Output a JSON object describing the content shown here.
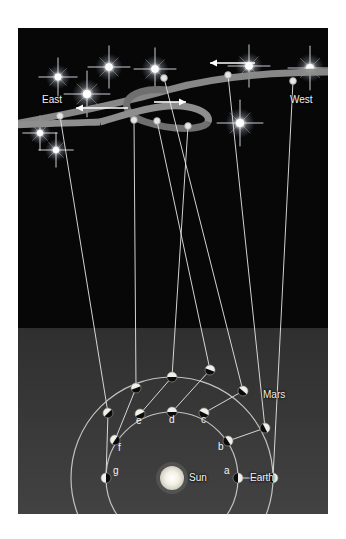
{
  "figure": {
    "title_text": "",
    "background_color": "#0a0a0a",
    "sky_color": "#070707",
    "ground_color": "#3a3a3a",
    "band_color": "#8e8e8e",
    "orbit_color": "#cfcfcf",
    "sightline_color": "#e8e8e8",
    "sun_color": "#f0efe8",
    "label_color": "#f2f2f2"
  },
  "labels": {
    "east": "East",
    "west": "West",
    "mars": "Mars",
    "sun": "Sun",
    "earth": "Earth"
  },
  "chart_data": {
    "type": "diagram",
    "sun": {
      "label": "Sun",
      "x": 154,
      "y": 450,
      "radius": 12
    },
    "earth_orbit": {
      "label": "Earth",
      "center_x": 154,
      "center_y": 450,
      "radius": 66
    },
    "mars_orbit": {
      "label": "Mars",
      "center_x": 154,
      "center_y": 450,
      "radius": 101
    },
    "earth_positions": [
      {
        "label": "a",
        "x": 220,
        "y": 450,
        "label_x": 206,
        "label_y": 446,
        "phase": "right"
      },
      {
        "label": "b",
        "x": 210,
        "y": 413,
        "label_x": 200,
        "label_y": 422,
        "phase": "right"
      },
      {
        "label": "c",
        "x": 186,
        "y": 385,
        "label_x": 183,
        "label_y": 395,
        "phase": "right"
      },
      {
        "label": "d",
        "x": 154,
        "y": 384,
        "label_x": 151,
        "label_y": 395,
        "phase": "top"
      },
      {
        "label": "e",
        "x": 122,
        "y": 386,
        "label_x": 118,
        "label_y": 396,
        "phase": "left"
      },
      {
        "label": "f",
        "x": 97,
        "y": 412,
        "label_x": 100,
        "label_y": 423,
        "phase": "left"
      },
      {
        "label": "g",
        "x": 88,
        "y": 450,
        "label_x": 95,
        "label_y": 446,
        "phase": "left"
      }
    ],
    "mars_positions": [
      {
        "label": "a",
        "x": 255,
        "y": 450
      },
      {
        "label": "b",
        "x": 247,
        "y": 400
      },
      {
        "label": "c",
        "x": 225,
        "y": 363
      },
      {
        "label": "d",
        "x": 192,
        "y": 342
      },
      {
        "label": "e",
        "x": 154,
        "y": 349
      },
      {
        "label": "f",
        "x": 118,
        "y": 360
      },
      {
        "label": "g",
        "x": 90,
        "y": 385
      }
    ],
    "sky_markers": [
      {
        "label": "a",
        "x": 275,
        "y": 53,
        "note": "west end of band"
      },
      {
        "label": "b",
        "x": 210,
        "y": 47,
        "note": "band, pre-loop"
      },
      {
        "label": "c",
        "x": 146,
        "y": 50,
        "note": "loop start upper"
      },
      {
        "label": "d",
        "x": 139,
        "y": 93,
        "note": "loop crossing"
      },
      {
        "label": "e",
        "x": 170,
        "y": 98,
        "note": "loop lower"
      },
      {
        "label": "f",
        "x": 116,
        "y": 92,
        "note": "band, post-loop"
      },
      {
        "label": "g",
        "x": 42,
        "y": 88,
        "note": "east end of band"
      }
    ],
    "arrows": [
      {
        "name": "upper-westward-arrow",
        "x1": 237,
        "y1": 35,
        "x2": 192,
        "y2": 35,
        "direction": "left"
      },
      {
        "name": "loop-eastward-arrow",
        "x1": 136,
        "y1": 74,
        "x2": 168,
        "y2": 74,
        "direction": "right"
      },
      {
        "name": "lower-westward-arrow",
        "x1": 110,
        "y1": 80,
        "x2": 58,
        "y2": 80,
        "direction": "left"
      }
    ],
    "stars": [
      {
        "x": 40,
        "y": 49,
        "size": 20
      },
      {
        "x": 91,
        "y": 39,
        "size": 22
      },
      {
        "x": 69,
        "y": 66,
        "size": 24
      },
      {
        "x": 137,
        "y": 41,
        "size": 22
      },
      {
        "x": 22,
        "y": 105,
        "size": 18
      },
      {
        "x": 231,
        "y": 38,
        "size": 22
      },
      {
        "x": 292,
        "y": 40,
        "size": 23
      },
      {
        "x": 222,
        "y": 95,
        "size": 24
      },
      {
        "x": 38,
        "y": 122,
        "size": 18
      }
    ],
    "annotations": [
      "East",
      "West",
      "Mars",
      "Sun",
      "Earth",
      "a",
      "b",
      "c",
      "d",
      "e",
      "f",
      "g"
    ]
  }
}
